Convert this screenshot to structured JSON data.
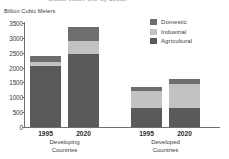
{
  "title": "Global Water Use by Sector",
  "axis_title": "Billion Cubic Meters",
  "legend": {
    "items": [
      {
        "label": "Domestic",
        "color": "#6e6e6e"
      },
      {
        "label": "Industrial",
        "color": "#c2c2c2"
      },
      {
        "label": "Agricultural",
        "color": "#5a5a5a"
      }
    ]
  },
  "y_ticks": [
    "3500",
    "3000",
    "2500",
    "2000",
    "1500",
    "1000",
    "500",
    "0"
  ],
  "groups": [
    {
      "name": "Developing Countries",
      "line1": "Developing",
      "line2": "Countries",
      "bars": [
        {
          "label": "1995"
        },
        {
          "label": "2020"
        }
      ]
    },
    {
      "name": "Developed Countries",
      "line1": "Developed",
      "line2": "Countries",
      "bars": [
        {
          "label": "1995"
        },
        {
          "label": "2020"
        }
      ]
    }
  ],
  "chart_data": {
    "type": "bar",
    "stacked": true,
    "title": "Global Water Use by Sector",
    "xlabel": "",
    "ylabel": "Billion Cubic Meters",
    "ylim": [
      0,
      3500
    ],
    "ytick_step": 500,
    "grid": false,
    "legend_position": "top-right",
    "categories": [
      "Developing Countries 1995",
      "Developing Countries 2020",
      "Developed Countries 1995",
      "Developed Countries 2020"
    ],
    "series": [
      {
        "name": "Agricultural",
        "color": "#5a5a5a",
        "values": [
          2050,
          2450,
          630,
          640
        ]
      },
      {
        "name": "Industrial",
        "color": "#c2c2c2",
        "values": [
          150,
          450,
          580,
          800
        ]
      },
      {
        "name": "Domestic",
        "color": "#6e6e6e",
        "values": [
          180,
          480,
          130,
          190
        ]
      }
    ],
    "totals": [
      2380,
      3380,
      1340,
      1630
    ],
    "stack_order_bottom_to_top": [
      "Agricultural",
      "Industrial",
      "Domestic"
    ]
  }
}
